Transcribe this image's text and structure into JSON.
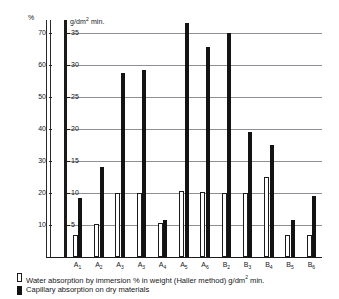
{
  "chart_data": {
    "type": "bar",
    "title": "",
    "subtitle": "",
    "categories": [
      "A1",
      "A2",
      "A3",
      "A3",
      "A4",
      "A5",
      "A6",
      "B2",
      "B3",
      "B4",
      "B5",
      "B6"
    ],
    "category_labels": [
      {
        "base": "A",
        "sub": "1"
      },
      {
        "base": "A",
        "sub": "2"
      },
      {
        "base": "A",
        "sub": "3"
      },
      {
        "base": "A",
        "sub": "3"
      },
      {
        "base": "A",
        "sub": "4"
      },
      {
        "base": "A",
        "sub": "5"
      },
      {
        "base": "A",
        "sub": "6"
      },
      {
        "base": "B",
        "sub": "2"
      },
      {
        "base": "B",
        "sub": "3"
      },
      {
        "base": "B",
        "sub": "4"
      },
      {
        "base": "B",
        "sub": "5"
      },
      {
        "base": "B",
        "sub": "6"
      }
    ],
    "series": [
      {
        "name": "Water absorption by immersion % in weight (Haller method) g/dm2 min.",
        "style": "white",
        "axis": "right",
        "values": [
          3.5,
          5.2,
          10.0,
          10.0,
          5.3,
          10.3,
          10.2,
          10.0,
          10.0,
          12.5,
          3.5,
          3.5
        ]
      },
      {
        "name": "Capillary absorption on dry materials",
        "style": "black",
        "axis": "right",
        "values": [
          9.2,
          14.0,
          28.8,
          29.2,
          5.8,
          36.5,
          32.8,
          35.0,
          19.5,
          17.5,
          5.8,
          9.5
        ]
      }
    ],
    "axis_left": {
      "unit": "%",
      "ticks": [
        10,
        20,
        30,
        40,
        50,
        60,
        70
      ],
      "min": 0,
      "max": 74,
      "grid": false
    },
    "axis_right": {
      "unit_parts": {
        "pre": "g/dm",
        "sup": "2",
        "post": " min."
      },
      "unit": "g/dm2 min.",
      "ticks": [
        5,
        10,
        15,
        20,
        25,
        30,
        35
      ],
      "min": 0,
      "max": 37,
      "grid": true
    },
    "grid": true,
    "legend_position": "bottom-left",
    "colors": {
      "bar_black": "#131313",
      "bar_white": "#ffffff",
      "outline": "#1b1b1b",
      "gridline": "#8d9094",
      "background": "#ffffff"
    }
  },
  "legend": {
    "items": [
      {
        "swatch": "white",
        "label": "Water absorption by immersion % in weight (Haller method) g/dm",
        "sup": "2",
        "tail": " min."
      },
      {
        "swatch": "black",
        "label": "Capillary absorption on dry materials",
        "sup": "",
        "tail": ""
      }
    ]
  }
}
